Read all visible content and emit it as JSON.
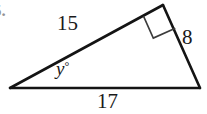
{
  "figure": {
    "problem_number": "5.",
    "shape": "triangle",
    "stroke_color": "#141414",
    "background_color": "#ffffff",
    "vertices": {
      "left": {
        "x": 10,
        "y": 88
      },
      "apex": {
        "x": 163,
        "y": 5
      },
      "right": {
        "x": 200,
        "y": 88
      }
    },
    "right_angle_marker": {
      "at_vertex": "apex",
      "size": 22,
      "label": "right-angle"
    },
    "labels": {
      "side_left": "15",
      "side_right": "8",
      "side_bottom": "17",
      "angle_left_value": "y",
      "angle_left_degree": "°"
    }
  }
}
